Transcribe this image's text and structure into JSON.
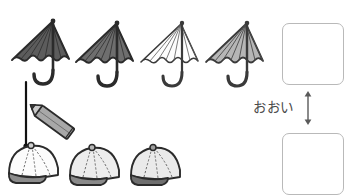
{
  "worksheet": {
    "title": "",
    "instruction_text": "",
    "comparison_label": "おおい",
    "rows": [
      {
        "row_name": "umbrellas",
        "item_icon": "umbrella-icon",
        "count": 4,
        "items": [
          {
            "index": 1,
            "fill": "#5c5c5c",
            "stroke": "#2b2b2b",
            "label": ""
          },
          {
            "index": 2,
            "fill": "#6e6e6e",
            "stroke": "#2b2b2b",
            "label": ""
          },
          {
            "index": 3,
            "fill": "#fdfdfd",
            "stroke": "#3a3a3a",
            "label": ""
          },
          {
            "index": 4,
            "fill": "#b6b6b6",
            "stroke": "#3a3a3a",
            "label": ""
          }
        ]
      },
      {
        "row_name": "caps",
        "item_icon": "baseball-cap-icon",
        "count": 3,
        "items": [
          {
            "index": 1,
            "fill": "#fcfcfc",
            "brim": "#8c8c8c",
            "stroke": "#2b2b2b",
            "label": ""
          },
          {
            "index": 2,
            "fill": "#ededed",
            "brim": "#8a8a8a",
            "stroke": "#2b2b2b",
            "label": ""
          },
          {
            "index": 3,
            "fill": "#eaeaea",
            "brim": "#6f6f6f",
            "stroke": "#2b2b2b",
            "label": ""
          }
        ]
      }
    ],
    "matching_line": {
      "name": "matching-line",
      "from": "umbrella-1-handle",
      "to": "cap-1-top",
      "color": "#111111"
    },
    "pencil": {
      "name": "pencil-icon",
      "body_color": "#a8a8a8",
      "tip_color": "#6a6a6a",
      "outline": "#2b2b2b"
    },
    "answer_boxes": [
      {
        "name": "answer-box-top",
        "value": "",
        "placeholder": ""
      },
      {
        "name": "answer-box-bottom",
        "value": "",
        "placeholder": ""
      }
    ],
    "arrow": {
      "name": "double-arrow-vertical",
      "direction": "both",
      "color": "#5a5a5a"
    },
    "colors": {
      "box_border": "#b9b9b9",
      "text": "#4a4a4a",
      "background": "#ffffff"
    }
  }
}
